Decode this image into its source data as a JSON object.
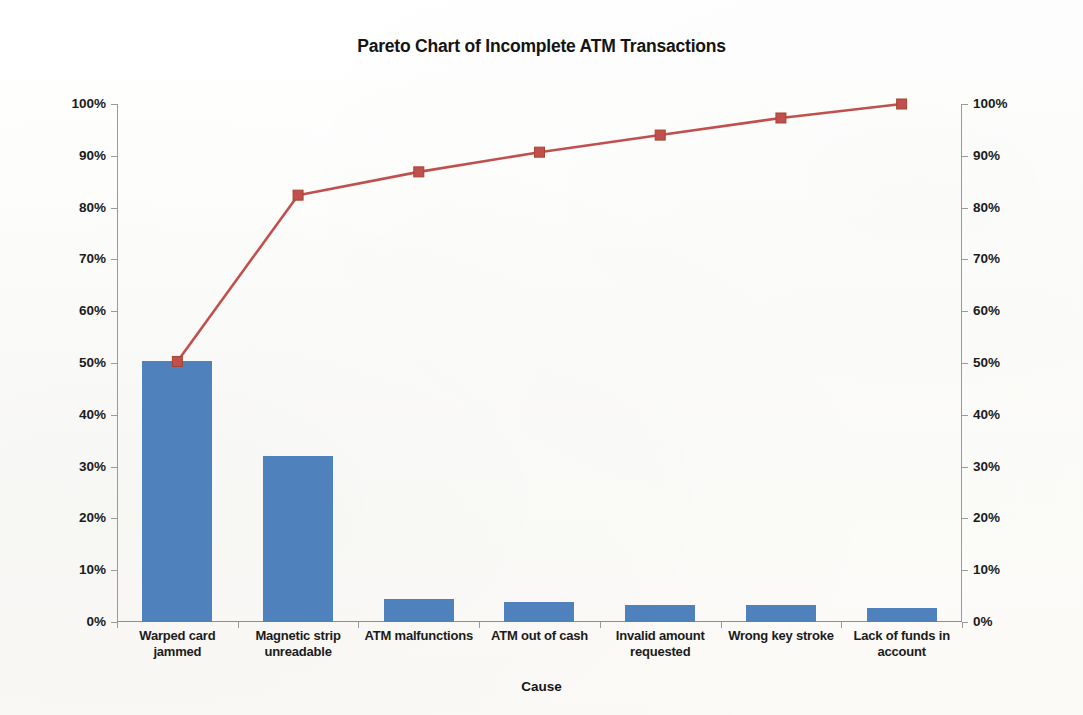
{
  "chart_data": {
    "type": "bar",
    "title": "Pareto Chart of Incomplete ATM Transactions",
    "xlabel": "Cause",
    "ylabel": "",
    "ylim": [
      0,
      100
    ],
    "y2lim": [
      0,
      100
    ],
    "grid": false,
    "legend": "none",
    "categories": [
      "Warped card jammed",
      "Magnetic strip unreadable",
      "ATM malfunctions",
      "ATM out of cash",
      "Invalid amount requested",
      "Wrong key stroke",
      "Lack of funds in account"
    ],
    "series": [
      {
        "name": "Percent of incomplete transactions",
        "kind": "bar",
        "axis": "left",
        "color": "#4f81bd",
        "values": [
          50.3,
          32.1,
          4.5,
          3.8,
          3.3,
          3.3,
          2.7
        ]
      },
      {
        "name": "Cumulative percent",
        "kind": "line",
        "axis": "right",
        "color": "#c0504d",
        "marker": "square",
        "values": [
          50.3,
          82.4,
          86.9,
          90.7,
          94.0,
          97.3,
          100.0
        ]
      }
    ],
    "ytick_labels": [
      "0%",
      "10%",
      "20%",
      "30%",
      "40%",
      "50%",
      "60%",
      "70%",
      "80%",
      "90%",
      "100%"
    ],
    "ytick_values": [
      0,
      10,
      20,
      30,
      40,
      50,
      60,
      70,
      80,
      90,
      100
    ],
    "y2tick_labels": [
      "0%",
      "10%",
      "20%",
      "30%",
      "40%",
      "50%",
      "60%",
      "70%",
      "80%",
      "90%",
      "100%"
    ],
    "y2tick_values": [
      0,
      10,
      20,
      30,
      40,
      50,
      60,
      70,
      80,
      90,
      100
    ]
  }
}
